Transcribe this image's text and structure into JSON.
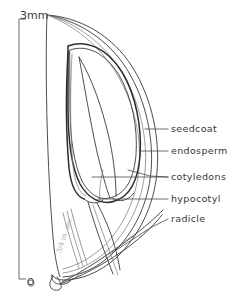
{
  "figure": {
    "background_color": "#ffffff",
    "ink_color": "#3a3a3a",
    "width_px": 232,
    "height_px": 302
  },
  "scale_bar": {
    "top_label": "3mm",
    "bottom_label": "O",
    "unit": "mm",
    "length_value": 3,
    "orientation": "vertical"
  },
  "annotation": {
    "pencil_note": "3/4 in. sec."
  },
  "labels": [
    {
      "id": "seedcoat",
      "text": "seedcoat"
    },
    {
      "id": "endosperm",
      "text": "endosperm"
    },
    {
      "id": "cotyledons",
      "text": "cotyledons"
    },
    {
      "id": "hypocotyl",
      "text": "hypocotyl"
    },
    {
      "id": "radicle",
      "text": "radicle"
    }
  ],
  "structures": [
    {
      "id": "seedcoat-outline",
      "name": "seed coat outer wall"
    },
    {
      "id": "endosperm-cavity",
      "name": "endosperm body"
    },
    {
      "id": "cotyledon-blade",
      "name": "cotyledons"
    },
    {
      "id": "hypocotyl-axis",
      "name": "hypocotyl"
    },
    {
      "id": "radicle-tip",
      "name": "radicle"
    }
  ]
}
